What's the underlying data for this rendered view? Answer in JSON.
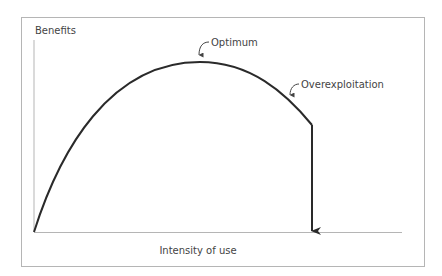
{
  "diagram": {
    "y_axis_label": "Benefits",
    "x_axis_label": "Intensity of use",
    "annotations": {
      "optimum": "Optimum",
      "overexploitation": "Overexploitation"
    },
    "colors": {
      "frame": "#b5b5b5",
      "axes": "#b5b5b5",
      "curve": "#2a2a2a",
      "text": "#444444"
    }
  }
}
